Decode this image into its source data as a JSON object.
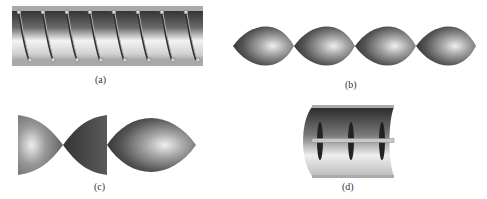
{
  "figure": {
    "panels": [
      {
        "id": "a",
        "label": "(a)",
        "description": "Tube with helical wire inserts along its length"
      },
      {
        "id": "b",
        "label": "(b)",
        "description": "Chain of four lens-shaped (twisted-tape style) elements"
      },
      {
        "id": "c",
        "label": "(c)",
        "description": "Half lens, inverted half lens and full lens elements"
      },
      {
        "id": "d",
        "label": "(d)",
        "description": "Half cylinder with a central rod and three baffle fins"
      }
    ],
    "colors": {
      "dark_metal": "#3a3a3a",
      "mid_metal": "#7a7a7a",
      "light_metal": "#f2f2f2",
      "rail": "#a8a8a8"
    }
  }
}
